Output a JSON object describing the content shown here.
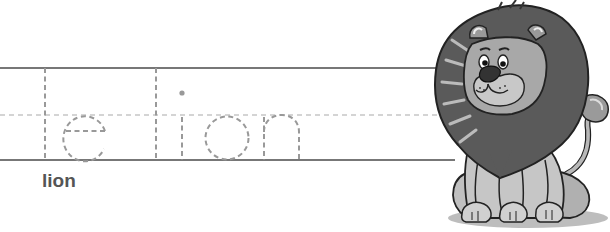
{
  "worksheet": {
    "word": "lion",
    "tracing_text": "le lion",
    "colors": {
      "guide_line": "#777777",
      "dashed_guide": "#a9a9a9",
      "trace_stroke": "#999999",
      "label": "#555555"
    },
    "illustration": {
      "subject": "lion",
      "alt": "cartoon lion sitting"
    }
  }
}
